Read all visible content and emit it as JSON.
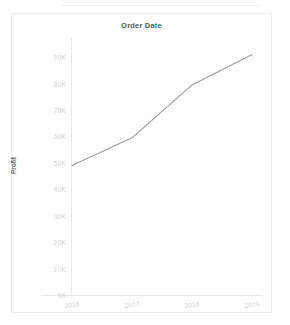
{
  "chart_data": {
    "type": "line",
    "title": "Order Date",
    "xlabel": "",
    "ylabel": "Profit",
    "categories": [
      "2016",
      "2017",
      "2018",
      "2019"
    ],
    "x": [
      2016,
      2017,
      2018,
      2019
    ],
    "values": [
      49000,
      59500,
      79500,
      91000
    ],
    "series": [
      {
        "name": "Profit",
        "values": [
          49000,
          59500,
          79500,
          91000
        ],
        "color": "#9b9ba0"
      }
    ],
    "ylim": [
      0,
      95000
    ],
    "yticks": [
      0,
      10000,
      20000,
      30000,
      40000,
      50000,
      60000,
      70000,
      80000,
      90000
    ],
    "ytick_labels": [
      "0K",
      "10K",
      "20K",
      "30K",
      "40K",
      "50K",
      "60K",
      "70K",
      "80K",
      "90K"
    ],
    "xtick_labels": [
      "2016",
      "2017",
      "2018",
      "2019"
    ],
    "grid": false,
    "legend": false,
    "line_color": "#9b9ba0",
    "axis_color": "#e8e8ea",
    "tick_label_color": "#cfcfd4",
    "title_color": "#5a5a5a"
  },
  "chart": {
    "title": "Order Date",
    "ylabel": "Profit"
  }
}
